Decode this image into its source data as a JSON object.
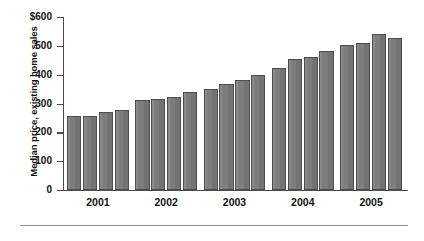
{
  "chart_data": {
    "type": "bar",
    "title": "",
    "subtitle": "",
    "xlabel": "",
    "ylabel": "Median price, existing home sales",
    "ylim": [
      0,
      600
    ],
    "ytick_labels": [
      "$600",
      "500",
      "400",
      "300",
      "200",
      "100",
      "0"
    ],
    "ytick_values": [
      600,
      500,
      400,
      300,
      200,
      100,
      0
    ],
    "grid": false,
    "legend": "none",
    "group_labels": [
      "2001",
      "2002",
      "2003",
      "2004",
      "2005"
    ],
    "categories": [
      "2001 Q1",
      "2001 Q2",
      "2001 Q3",
      "2001 Q4",
      "2002 Q1",
      "2002 Q2",
      "2002 Q3",
      "2002 Q4",
      "2003 Q1",
      "2003 Q2",
      "2003 Q3",
      "2003 Q4",
      "2004 Q1",
      "2004 Q2",
      "2004 Q3",
      "2004 Q4",
      "2005 Q1",
      "2005 Q2",
      "2005 Q3",
      "2005 Q4"
    ],
    "values": [
      256,
      256,
      272,
      279,
      311,
      316,
      324,
      340,
      350,
      368,
      383,
      400,
      423,
      453,
      461,
      482,
      503,
      511,
      540,
      528
    ],
    "bar_color": "#808080",
    "bar_edge_color": "#4d4d4d",
    "axis_color": "#4a4a4a"
  }
}
